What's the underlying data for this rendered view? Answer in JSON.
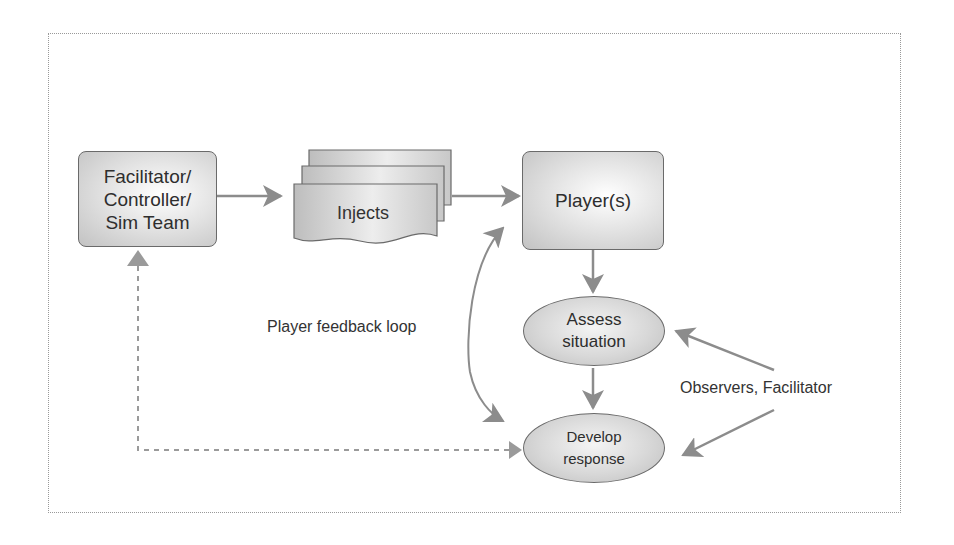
{
  "diagram": {
    "nodes": {
      "facilitator": {
        "label": "Facilitator/\nController/\nSim Team"
      },
      "injects": {
        "label": "Injects"
      },
      "players": {
        "label": "Player(s)"
      },
      "assess": {
        "label": "Assess\nsituation"
      },
      "develop": {
        "label": "Develop\nresponse"
      }
    },
    "labels": {
      "feedback_loop": "Player feedback loop",
      "observers": "Observers, Facilitator"
    },
    "edges": [
      {
        "from": "facilitator",
        "to": "injects",
        "style": "solid"
      },
      {
        "from": "injects",
        "to": "players",
        "style": "solid"
      },
      {
        "from": "players",
        "to": "assess",
        "style": "solid"
      },
      {
        "from": "assess",
        "to": "develop",
        "style": "solid"
      },
      {
        "from": "develop",
        "to": "players",
        "style": "curved-bidirectional",
        "label": "Player feedback loop"
      },
      {
        "from": "observers",
        "to": "assess",
        "style": "solid"
      },
      {
        "from": "observers",
        "to": "develop",
        "style": "solid"
      },
      {
        "from": "develop",
        "to": "facilitator",
        "style": "dashed"
      }
    ],
    "colors": {
      "arrow": "#8c8c8c",
      "node_border": "#6a6a6a",
      "frame": "#999999"
    }
  }
}
